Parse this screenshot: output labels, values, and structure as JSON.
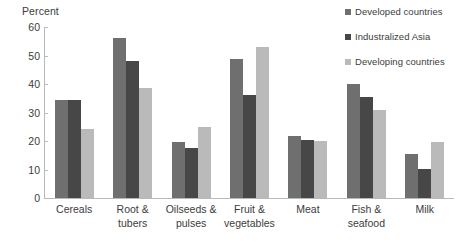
{
  "chart_data": {
    "type": "bar",
    "title": "",
    "subtitle": "",
    "xlabel": "",
    "ylabel": "Percent",
    "ylim": [
      0,
      60
    ],
    "yticks": [
      0,
      10,
      20,
      30,
      40,
      50,
      60
    ],
    "grid": false,
    "legend_position": "top-right",
    "categories": [
      "Cereals",
      "Root & tubers",
      "Oilseeds & pulses",
      "Fruit & vegetables",
      "Meat",
      "Fish & seafood",
      "Milk"
    ],
    "category_lines": [
      [
        "Cereals"
      ],
      [
        "Root &",
        "tubers"
      ],
      [
        "Oilseeds &",
        "pulses"
      ],
      [
        "Fruit &",
        "vegetables"
      ],
      [
        "Meat"
      ],
      [
        "Fish &",
        "seafood"
      ],
      [
        "Milk"
      ]
    ],
    "series": [
      {
        "name": "Developed countries",
        "color": "#6f6f6f",
        "values": [
          34.5,
          56.0,
          19.8,
          48.8,
          21.7,
          40.1,
          15.3
        ]
      },
      {
        "name": "Industralized Asia",
        "color": "#474747",
        "values": [
          34.3,
          48.0,
          17.4,
          36.1,
          20.2,
          35.3,
          10.1
        ]
      },
      {
        "name": "Developing countries",
        "color": "#bababa",
        "values": [
          24.1,
          38.5,
          24.9,
          53.0,
          20.0,
          31.0,
          19.5
        ]
      }
    ]
  },
  "legend": {
    "items": [
      {
        "label": "Developed countries"
      },
      {
        "label": "Industralized Asia"
      },
      {
        "label": "Developing countries"
      }
    ]
  },
  "axis": {
    "y_title": "Percent",
    "y_tick_labels": [
      "60",
      "50",
      "40",
      "30",
      "20",
      "10",
      "0"
    ]
  }
}
